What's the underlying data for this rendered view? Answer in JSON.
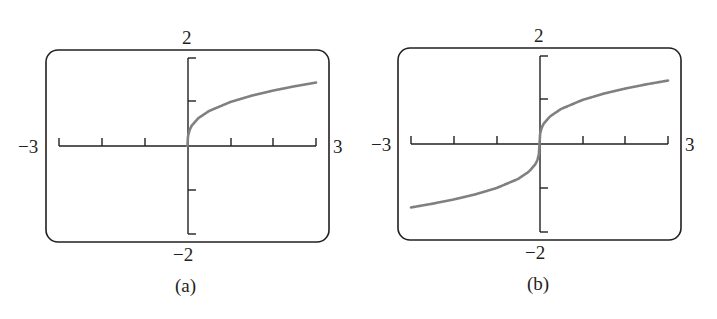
{
  "colors": {
    "frame": "#231f20",
    "axis": "#231f20",
    "curve": "#808080",
    "background": "#ffffff"
  },
  "panels": [
    {
      "caption": "(a)",
      "ymax_label": "2",
      "ymin_label": "−2",
      "xmin_label": "−3",
      "xmax_label": "3"
    },
    {
      "caption": "(b)",
      "ymax_label": "2",
      "ymin_label": "−2",
      "xmin_label": "−3",
      "xmax_label": "3"
    }
  ],
  "chart_data": [
    {
      "type": "line",
      "title": "(a)",
      "description": "Graph of y = x^(1/3) restricted to x >= 0 (calculator screen)",
      "xlabel": "",
      "ylabel": "",
      "xlim": [
        -3,
        3
      ],
      "ylim": [
        -2,
        2
      ],
      "xticks": [
        -3,
        -2,
        -1,
        0,
        1,
        2,
        3
      ],
      "yticks": [
        -2,
        -1,
        0,
        1,
        2
      ],
      "window_labels": {
        "xmin": "-3",
        "xmax": "3",
        "ymin": "-2",
        "ymax": "2"
      },
      "grid": false,
      "legend": null,
      "series": [
        {
          "name": "curve",
          "x": [
            0,
            0.01,
            0.05,
            0.1,
            0.25,
            0.5,
            1,
            1.5,
            2,
            2.5,
            3
          ],
          "y": [
            0,
            0.215,
            0.368,
            0.464,
            0.63,
            0.794,
            1.0,
            1.145,
            1.26,
            1.357,
            1.442
          ]
        }
      ]
    },
    {
      "type": "line",
      "title": "(b)",
      "description": "Graph of y = x^(1/3) over full window (calculator screen)",
      "xlabel": "",
      "ylabel": "",
      "xlim": [
        -3,
        3
      ],
      "ylim": [
        -2,
        2
      ],
      "xticks": [
        -3,
        -2,
        -1,
        0,
        1,
        2,
        3
      ],
      "yticks": [
        -2,
        -1,
        0,
        1,
        2
      ],
      "window_labels": {
        "xmin": "-3",
        "xmax": "3",
        "ymin": "-2",
        "ymax": "2"
      },
      "grid": false,
      "legend": null,
      "series": [
        {
          "name": "curve",
          "x": [
            -3,
            -2.5,
            -2,
            -1.5,
            -1,
            -0.5,
            -0.25,
            -0.1,
            -0.05,
            -0.01,
            0,
            0.01,
            0.05,
            0.1,
            0.25,
            0.5,
            1,
            1.5,
            2,
            2.5,
            3
          ],
          "y": [
            -1.442,
            -1.357,
            -1.26,
            -1.145,
            -1.0,
            -0.794,
            -0.63,
            -0.464,
            -0.368,
            -0.215,
            0,
            0.215,
            0.368,
            0.464,
            0.63,
            0.794,
            1.0,
            1.145,
            1.26,
            1.357,
            1.442
          ]
        }
      ]
    }
  ]
}
